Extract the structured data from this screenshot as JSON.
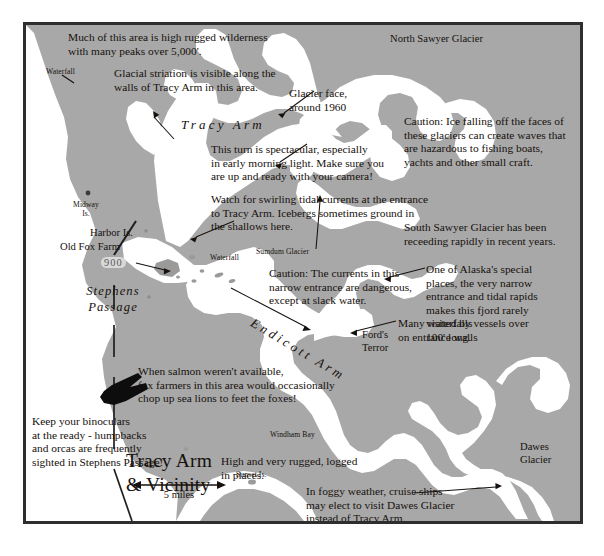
{
  "map": {
    "title": "Tracy Arm\n& Vicinity",
    "scale_label": "5 miles",
    "colors": {
      "land": "#a8a8a8",
      "water": "#ffffff",
      "border": "#2e2e2e",
      "text": "#17110d",
      "page_background": "#ffffff",
      "depth_pill": "#d9d9d9"
    },
    "notes": [
      {
        "id": "wilderness",
        "text": "Much of this area is high rugged wilderness\nwith many peaks over 5,000'."
      },
      {
        "id": "striation",
        "text": "Glacial striation is visible along the\nwalls of Tracy Arm in this area."
      },
      {
        "id": "glacier-face",
        "text": "Glacier face,\naround 1960"
      },
      {
        "id": "ice-caution",
        "text": "Caution: Ice falling off the faces of\nthese glaciers can create waves that\nare hazardous to fishing boats,\nyachts and other small craft."
      },
      {
        "id": "turn",
        "text": "This turn is spectacular, especially\nin early morning light. Make sure you\nare up and ready with your camera!"
      },
      {
        "id": "tidal",
        "text": "Watch for swirling tidal currents at the entrance\nto Tracy Arm. Icebergs sometimes ground in\nthe shallows here."
      },
      {
        "id": "south-sawyer",
        "text": "South Sawyer Glacier has been\nreceeding rapidly in recent years."
      },
      {
        "id": "currents",
        "text": "Caution: The currents in this\nnarrow entrance are dangerous,\nexcept at slack water."
      },
      {
        "id": "alaska-special",
        "text": "One of Alaska's special\nplaces, the very narrow\nentrance and tidal rapids\nmakes this fjord rarely\nvisited by vessels over\n100' long."
      },
      {
        "id": "waterfalls",
        "text": "Many waterfalls\non entrance walls"
      },
      {
        "id": "salmon",
        "text": "When salmon weren't available,\nfox farmers in this area would occasionally\nchop up sea lions to feet the foxes!"
      },
      {
        "id": "binoculars",
        "text": "Keep your binoculars\nat the ready - humpbacks\nand orcas are frequently\nsighted in Stephens Passage!"
      },
      {
        "id": "rugged-logged",
        "text": "High and very rugged, logged\nin places."
      },
      {
        "id": "foggy",
        "text": "In foggy weather, cruise ships\nmay elect to visit Dawes Glacier\ninstead of Tracy Arm."
      }
    ],
    "water_names": [
      {
        "id": "tracy-arm",
        "text": "Tracy Arm"
      },
      {
        "id": "endicott-arm",
        "text": "Endicott Arm"
      }
    ],
    "passage_name": "Stephens\nPassage",
    "depth_sounding": "900",
    "place_labels": [
      {
        "id": "north-sawyer-glacier",
        "text": "North Sawyer Glacier",
        "size": "place"
      },
      {
        "id": "harbor-is",
        "text": "Harbor Is.",
        "size": "place"
      },
      {
        "id": "old-fox-farm",
        "text": "Old Fox Farm",
        "size": "place"
      },
      {
        "id": "fords-terror",
        "text": "Ford's\nTerror",
        "size": "place"
      },
      {
        "id": "dawes-glacier",
        "text": "Dawes\nGlacier",
        "size": "place"
      }
    ],
    "small_labels": [
      {
        "id": "waterfall-nw",
        "text": "Waterfall"
      },
      {
        "id": "midway-is",
        "text": "Midway\nIs."
      },
      {
        "id": "waterfall-center",
        "text": "Waterfall"
      },
      {
        "id": "sumdum-glacier",
        "text": "Sumdum Glacier"
      },
      {
        "id": "windham-bay",
        "text": "Windham Bay"
      },
      {
        "id": "sunset-is",
        "text": "Sunset Is."
      }
    ],
    "icons": [
      {
        "id": "whale-fluke-icon",
        "name": "whale-fluke-icon"
      }
    ]
  }
}
